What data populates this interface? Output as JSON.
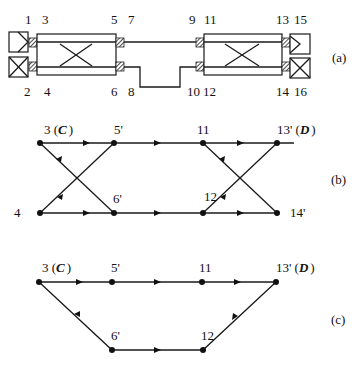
{
  "panel_a": {
    "caption": "(a)",
    "port_labels_top": [
      "1",
      "3",
      "5",
      "7",
      "9",
      "11",
      "13",
      "15"
    ],
    "port_labels_bottom": [
      "2",
      "4",
      "6",
      "8",
      "10",
      "12",
      "14",
      "16"
    ],
    "components": [
      "left-endpoint-top",
      "left-endpoint-bottom",
      "left-coupler",
      "connecting-waveguides",
      "right-coupler",
      "right-endpoint-top",
      "right-endpoint-bottom"
    ]
  },
  "panel_b": {
    "caption": "(b)",
    "nodes": {
      "n3": "3 (",
      "n3_letter": "C",
      "n3_close": ")",
      "n5": "5'",
      "n11": "11",
      "n13": "13' (",
      "n13_letter": "D",
      "n13_close": ")",
      "n4": "4",
      "n6": "6'",
      "n12": "12",
      "n14": "14'"
    },
    "edges": [
      [
        "3",
        "5'"
      ],
      [
        "3",
        "6'"
      ],
      [
        "4",
        "5'"
      ],
      [
        "4",
        "6'"
      ],
      [
        "5'",
        "11"
      ],
      [
        "6'",
        "12"
      ],
      [
        "11",
        "13'"
      ],
      [
        "11",
        "14'"
      ],
      [
        "12",
        "13'"
      ],
      [
        "12",
        "14'"
      ]
    ]
  },
  "panel_c": {
    "caption": "(c)",
    "nodes": {
      "n3": "3 (",
      "n3_letter": "C",
      "n3_close": ")",
      "n5": "5'",
      "n11": "11",
      "n13": "13' (",
      "n13_letter": "D",
      "n13_close": ")",
      "n6": "6'",
      "n12": "12"
    },
    "edges": [
      [
        "3",
        "5'"
      ],
      [
        "5'",
        "11"
      ],
      [
        "11",
        "13'"
      ],
      [
        "3",
        "6'"
      ],
      [
        "6'",
        "12"
      ],
      [
        "12",
        "13'"
      ]
    ]
  }
}
